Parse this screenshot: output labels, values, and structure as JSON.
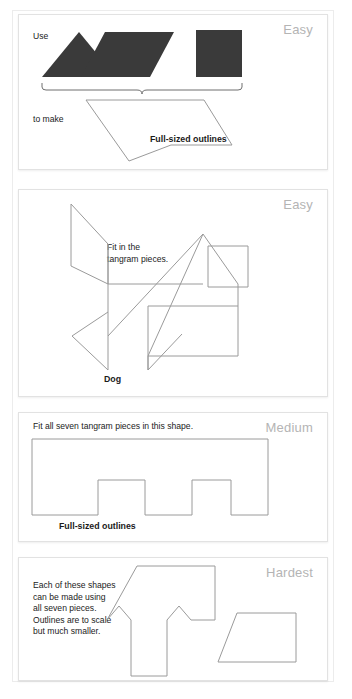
{
  "page": {
    "background_color": "#ffffff",
    "piece_fill_color": "#3a3a3a",
    "outline_stroke_color": "#9a9a9a",
    "difficulty_label_color": "#b4b4b4"
  },
  "panels": [
    {
      "id": "panel-easy-arrow",
      "difficulty": "Easy",
      "use_label": "Use",
      "to_make_label": "to make",
      "footer_label": "Full-sized outlines",
      "pieces": [
        {
          "name": "large-triangle",
          "shape": "triangle"
        },
        {
          "name": "parallelogram",
          "shape": "parallelogram"
        },
        {
          "name": "square",
          "shape": "square"
        }
      ],
      "target_outline": "arrow"
    },
    {
      "id": "panel-easy-dog",
      "difficulty": "Easy",
      "instruction": "Fit in the\ntangram pieces.",
      "footer_label": "Dog",
      "target_outline": "dog"
    },
    {
      "id": "panel-medium",
      "difficulty": "Medium",
      "instruction": "Fit all seven tangram pieces in this shape.",
      "footer_label": "Full-sized outlines",
      "target_outline": "castle-battlement"
    },
    {
      "id": "panel-hardest",
      "difficulty": "Hardest",
      "instruction": "Each of these shapes\ncan be made using\nall seven pieces.\nOutlines are to scale\nbut much smaller.",
      "target_outlines": [
        "tee-shape",
        "trapezoid"
      ]
    }
  ]
}
